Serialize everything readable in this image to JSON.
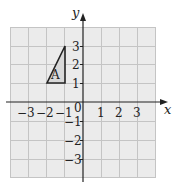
{
  "diagram": {
    "type": "coordinate-grid",
    "x_axis": {
      "label": "x",
      "ticks": [
        "-3",
        "-2",
        "-1",
        "1",
        "2",
        "3"
      ],
      "range": [
        -4,
        4
      ]
    },
    "y_axis": {
      "label": "y",
      "ticks": [
        "3",
        "2",
        "1",
        "-1",
        "-2",
        "-3"
      ],
      "range": [
        -4,
        4
      ]
    },
    "origin_label": "0",
    "shape": {
      "label": "A",
      "type": "triangle",
      "vertices": [
        [
          -2,
          1
        ],
        [
          -1,
          1
        ],
        [
          -1,
          3
        ]
      ]
    },
    "colors": {
      "grid_fill": "#ebebeb",
      "grid_line": "#c4c4c4",
      "axis": "#222222",
      "shape_fill": "#d8d8d8"
    }
  }
}
